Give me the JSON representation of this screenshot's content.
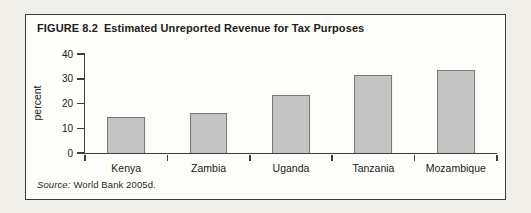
{
  "figure": {
    "number": "FIGURE 8.2",
    "caption": "Estimated Unreported Revenue for Tax Purposes",
    "source_label": "Source:",
    "source_text": "World Bank 2005d."
  },
  "chart_data": {
    "type": "bar",
    "categories": [
      "Kenya",
      "Zambia",
      "Uganda",
      "Tanzania",
      "Mozambique"
    ],
    "values": [
      14.5,
      16,
      23.5,
      31.5,
      33.5
    ],
    "xlabel": "",
    "ylabel": "percent",
    "ylim": [
      0,
      40
    ],
    "yticks": [
      0,
      10,
      20,
      30,
      40
    ],
    "grid": false,
    "legend": false,
    "bar_width_fraction_of_slot": 0.46,
    "source": "Source: World Bank 2005d."
  },
  "colors": {
    "page_bg": "#efeee9",
    "frame_bg": "#fdfdfa",
    "frame_border": "#3b3b3b",
    "text": "#212121",
    "axis": "#3d3d3d",
    "bar_fill": "#c4c4c4",
    "bar_border": "#787878"
  }
}
